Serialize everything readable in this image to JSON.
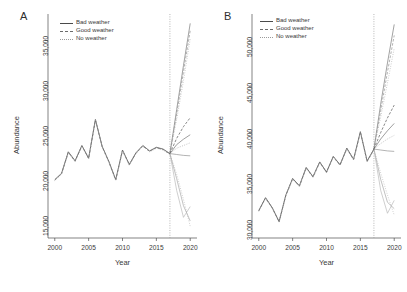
{
  "figure": {
    "width": 407,
    "height": 292,
    "background": "#ffffff",
    "axis_color": "#4d4d4d"
  },
  "legend": {
    "position": "top-left-inside",
    "entries": [
      {
        "label": "Bad weather",
        "style": "solid",
        "color": "#4a4a4a"
      },
      {
        "label": "Good weather",
        "style": "dashed",
        "color": "#6b6b6b"
      },
      {
        "label": "No weather",
        "style": "dotted",
        "color": "#9a9a9a"
      }
    ]
  },
  "chart_data": [
    {
      "type": "line",
      "panel": "A",
      "title": "A",
      "xlabel": "Year",
      "ylabel": "Abundance",
      "xlim": [
        1999,
        2021
      ],
      "ylim": [
        13000,
        37500
      ],
      "xticks": [
        2000,
        2005,
        2010,
        2015,
        2020
      ],
      "xtick_labels": [
        "2000",
        "2005",
        "2010",
        "2015",
        "2020"
      ],
      "yticks": [
        15000,
        20000,
        25000,
        30000,
        35000
      ],
      "ytick_labels": [
        "15,000",
        "20,000",
        "25,000",
        "30,000",
        "35,000"
      ],
      "grid": false,
      "forecast_start_year": 2017,
      "forecast_divider": {
        "year": 2017,
        "style": "dotted",
        "color": "#9a9a9a"
      },
      "x": [
        2000,
        2001,
        2002,
        2003,
        2004,
        2005,
        2006,
        2007,
        2008,
        2009,
        2010,
        2011,
        2012,
        2013,
        2014,
        2015,
        2016,
        2017
      ],
      "series": [
        {
          "name": "Observed (Bad weather)",
          "style": "solid",
          "color": "#4a4a4a",
          "segment": "historical",
          "values": [
            19500,
            20200,
            22600,
            21600,
            23300,
            21900,
            26200,
            23200,
            21500,
            19500,
            22800,
            21200,
            22500,
            23300,
            22700,
            23100,
            22900,
            22400
          ]
        },
        {
          "name": "Observed (Good weather)",
          "style": "dashed",
          "color": "#6b6b6b",
          "segment": "historical",
          "values": [
            19450,
            20150,
            22550,
            21550,
            23250,
            21850,
            26150,
            23150,
            21450,
            19450,
            22750,
            21150,
            22450,
            23250,
            22650,
            23050,
            22850,
            22350
          ]
        },
        {
          "name": "Observed (No weather)",
          "style": "dotted",
          "color": "#a8a8a8",
          "segment": "historical",
          "values": [
            19400,
            20100,
            22500,
            21500,
            23200,
            21800,
            26100,
            23100,
            21400,
            19400,
            22700,
            21100,
            22400,
            23200,
            22600,
            23000,
            22800,
            22300
          ]
        }
      ],
      "forecasts": {
        "x": [
          2017,
          2018,
          2019,
          2020
        ],
        "lines": [
          {
            "name": "bad-high",
            "style": "solid",
            "color": "#6f6f6f",
            "values": [
              22400,
              27300,
              32200,
              36900
            ]
          },
          {
            "name": "good-high",
            "style": "dashed",
            "color": "#8a8a8a",
            "values": [
              22400,
              26800,
              31500,
              36100
            ]
          },
          {
            "name": "no-high",
            "style": "dotted",
            "color": "#a8a8a8",
            "values": [
              22400,
              26200,
              30500,
              35200
            ]
          },
          {
            "name": "bad-mid",
            "style": "dashed",
            "color": "#4a4a4a",
            "values": [
              22400,
              24100,
              25400,
              26400
            ]
          },
          {
            "name": "good-mid",
            "style": "solid",
            "color": "#6b6b6b",
            "values": [
              22400,
              23400,
              24000,
              24500
            ]
          },
          {
            "name": "no-mid",
            "style": "dotted",
            "color": "#9a9a9a",
            "values": [
              22400,
              23000,
              23300,
              23600
            ]
          },
          {
            "name": "bad-flat",
            "style": "solid",
            "color": "#8a8a8a",
            "values": [
              22400,
              22300,
              22200,
              22150
            ]
          },
          {
            "name": "good-low",
            "style": "dotted",
            "color": "#b0b0b0",
            "values": [
              22400,
              20100,
              17300,
              14300
            ]
          },
          {
            "name": "no-low",
            "style": "solid",
            "color": "#a0a0a0",
            "values": [
              22400,
              19600,
              16600,
              14900
            ]
          },
          {
            "name": "low-rebound",
            "style": "solid",
            "color": "#b5b5b5",
            "values": [
              22400,
              18300,
              15300,
              16500
            ]
          }
        ]
      }
    },
    {
      "type": "line",
      "panel": "B",
      "title": "B",
      "xlabel": "Year",
      "ylabel": "Abundance",
      "xlim": [
        1999,
        2021
      ],
      "ylim": [
        28500,
        52500
      ],
      "xticks": [
        2000,
        2005,
        2010,
        2015,
        2020
      ],
      "xtick_labels": [
        "2000",
        "2005",
        "2010",
        "2015",
        "2020"
      ],
      "yticks": [
        30000,
        35000,
        40000,
        45000,
        50000
      ],
      "ytick_labels": [
        "30,000",
        "35,000",
        "40,000",
        "45,000",
        "50,000"
      ],
      "grid": false,
      "forecast_start_year": 2017,
      "forecast_divider": {
        "year": 2017,
        "style": "dotted",
        "color": "#9a9a9a"
      },
      "x": [
        2000,
        2001,
        2002,
        2003,
        2004,
        2005,
        2006,
        2007,
        2008,
        2009,
        2010,
        2011,
        2012,
        2013,
        2014,
        2015,
        2016,
        2017
      ],
      "series": [
        {
          "name": "Observed (Bad weather)",
          "style": "solid",
          "color": "#4a4a4a",
          "segment": "historical",
          "values": [
            31500,
            32900,
            31800,
            30300,
            33200,
            35000,
            34200,
            36200,
            35200,
            36800,
            35700,
            37400,
            36500,
            38300,
            37100,
            40100,
            36900,
            38200
          ]
        },
        {
          "name": "Observed (Good weather)",
          "style": "dashed",
          "color": "#6b6b6b",
          "segment": "historical",
          "values": [
            31450,
            32850,
            31750,
            30250,
            33150,
            34950,
            34150,
            36150,
            35150,
            36750,
            35650,
            37350,
            36450,
            38250,
            37050,
            40050,
            36850,
            38150
          ]
        },
        {
          "name": "Observed (No weather)",
          "style": "dotted",
          "color": "#a8a8a8",
          "segment": "historical",
          "values": [
            31400,
            32800,
            31700,
            30200,
            33100,
            34900,
            34100,
            36100,
            35100,
            36700,
            35600,
            37300,
            36400,
            38200,
            37000,
            40000,
            36800,
            38100
          ]
        }
      ],
      "forecasts": {
        "x": [
          2017,
          2018,
          2019,
          2020
        ],
        "lines": [
          {
            "name": "bad-high",
            "style": "solid",
            "color": "#6f6f6f",
            "values": [
              38200,
              43100,
              47600,
              51800
            ]
          },
          {
            "name": "good-high",
            "style": "dashed",
            "color": "#8a8a8a",
            "values": [
              38200,
              42400,
              46600,
              50600
            ]
          },
          {
            "name": "no-high",
            "style": "dotted",
            "color": "#a8a8a8",
            "values": [
              38200,
              41700,
              45400,
              49200
            ]
          },
          {
            "name": "bad-mid",
            "style": "dashed",
            "color": "#4a4a4a",
            "values": [
              38200,
              40000,
              41600,
              43000
            ]
          },
          {
            "name": "good-mid",
            "style": "solid",
            "color": "#6b6b6b",
            "values": [
              38200,
              39300,
              40200,
              41000
            ]
          },
          {
            "name": "no-mid",
            "style": "dotted",
            "color": "#9a9a9a",
            "values": [
              38200,
              38800,
              39300,
              39700
            ]
          },
          {
            "name": "bad-flat",
            "style": "solid",
            "color": "#8a8a8a",
            "values": [
              38200,
              38100,
              38000,
              37950
            ]
          },
          {
            "name": "good-low",
            "style": "dotted",
            "color": "#b0b0b0",
            "values": [
              38200,
              35600,
              33200,
              31000
            ]
          },
          {
            "name": "no-low",
            "style": "solid",
            "color": "#a0a0a0",
            "values": [
              38200,
              34900,
              32400,
              31700
            ]
          },
          {
            "name": "low-rebound",
            "style": "solid",
            "color": "#b5b5b5",
            "values": [
              38200,
              33700,
              31200,
              32600
            ]
          }
        ]
      }
    }
  ]
}
